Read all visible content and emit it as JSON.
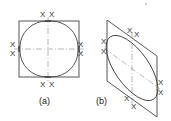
{
  "figures": [
    {
      "id": "a",
      "caption": "(a)",
      "shape": "square",
      "inscribed": "circle",
      "marks": [
        "X",
        "X",
        "X",
        "X",
        "X",
        "X",
        "X",
        "X"
      ]
    },
    {
      "id": "b",
      "caption": "(b)",
      "shape": "rhombus",
      "inscribed": "ellipse",
      "marks": [
        "X",
        "X",
        "X",
        "X",
        "X",
        "X",
        "X",
        "X"
      ]
    }
  ],
  "colors": {
    "line": "#444444",
    "centerline": "#888888",
    "background": "#ffffff"
  }
}
